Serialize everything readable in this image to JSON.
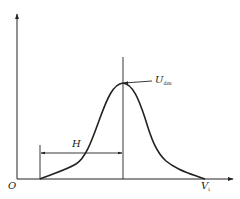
{
  "figure": {
    "origin_label": "O",
    "x_axis_label": "V",
    "x_axis_label_sub": "i",
    "width_label": "H",
    "peak_label": "U",
    "peak_label_sub": "dm",
    "colors": {
      "line": "#222222",
      "background": "#ffffff"
    }
  }
}
